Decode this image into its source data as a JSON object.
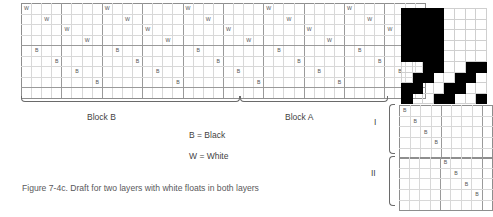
{
  "figure": {
    "caption": "Figure 7-4c. Draft for two layers with white floats in both layers",
    "legend": {
      "black": "B = Black",
      "white": "W = White"
    },
    "blocks": {
      "block_b_label": "Block B",
      "block_a_label": "Block A"
    },
    "layer_labels": {
      "layer_one": "I",
      "layer_two": "II"
    },
    "marks": {
      "black": "B",
      "white": "W"
    },
    "colors": {
      "black": "#000000",
      "white": "#ffffff",
      "grid_line": "#d8d8d8",
      "grid_line_major": "#9a9a9a",
      "text": "#3f3f3f",
      "caption_text": "#59595b"
    }
  },
  "main_draft": {
    "columns": 40,
    "rows": 9,
    "group_size": 4,
    "block_b_columns": [
      0,
      23
    ],
    "block_a_columns": [
      24,
      39
    ],
    "cells": [
      {
        "row": 0,
        "col": 0,
        "mark": "W"
      },
      {
        "row": 0,
        "col": 8,
        "mark": "W"
      },
      {
        "row": 0,
        "col": 16,
        "mark": "W"
      },
      {
        "row": 0,
        "col": 24,
        "mark": "W"
      },
      {
        "row": 0,
        "col": 32,
        "mark": "W"
      },
      {
        "row": 1,
        "col": 2,
        "mark": "W"
      },
      {
        "row": 1,
        "col": 10,
        "mark": "W"
      },
      {
        "row": 1,
        "col": 18,
        "mark": "W"
      },
      {
        "row": 1,
        "col": 26,
        "mark": "W"
      },
      {
        "row": 1,
        "col": 34,
        "mark": "W"
      },
      {
        "row": 2,
        "col": 4,
        "mark": "W"
      },
      {
        "row": 2,
        "col": 12,
        "mark": "W"
      },
      {
        "row": 2,
        "col": 20,
        "mark": "W"
      },
      {
        "row": 2,
        "col": 28,
        "mark": "W"
      },
      {
        "row": 2,
        "col": 36,
        "mark": "W"
      },
      {
        "row": 3,
        "col": 6,
        "mark": "W"
      },
      {
        "row": 3,
        "col": 14,
        "mark": "W"
      },
      {
        "row": 3,
        "col": 22,
        "mark": "W"
      },
      {
        "row": 3,
        "col": 30,
        "mark": "W"
      },
      {
        "row": 3,
        "col": 38,
        "mark": "W"
      },
      {
        "row": 4,
        "col": 1,
        "mark": "B"
      },
      {
        "row": 4,
        "col": 9,
        "mark": "B"
      },
      {
        "row": 4,
        "col": 17,
        "mark": "B"
      },
      {
        "row": 4,
        "col": 25,
        "mark": "B"
      },
      {
        "row": 4,
        "col": 33,
        "mark": "B"
      },
      {
        "row": 5,
        "col": 3,
        "mark": "B"
      },
      {
        "row": 5,
        "col": 11,
        "mark": "B"
      },
      {
        "row": 5,
        "col": 19,
        "mark": "B"
      },
      {
        "row": 5,
        "col": 27,
        "mark": "B"
      },
      {
        "row": 5,
        "col": 35,
        "mark": "B"
      },
      {
        "row": 6,
        "col": 5,
        "mark": "B"
      },
      {
        "row": 6,
        "col": 13,
        "mark": "B"
      },
      {
        "row": 6,
        "col": 21,
        "mark": "B"
      },
      {
        "row": 6,
        "col": 29,
        "mark": "B"
      },
      {
        "row": 6,
        "col": 37,
        "mark": "B"
      },
      {
        "row": 7,
        "col": 7,
        "mark": "B"
      },
      {
        "row": 7,
        "col": 15,
        "mark": "B"
      },
      {
        "row": 7,
        "col": 23,
        "mark": "B"
      },
      {
        "row": 7,
        "col": 31,
        "mark": "B"
      },
      {
        "row": 7,
        "col": 39,
        "mark": "B"
      }
    ]
  },
  "pattern_grid": {
    "columns": 8,
    "rows": 9,
    "black_cells": [
      [
        0,
        0
      ],
      [
        0,
        1
      ],
      [
        0,
        2
      ],
      [
        0,
        3
      ],
      [
        1,
        0
      ],
      [
        1,
        1
      ],
      [
        1,
        2
      ],
      [
        1,
        3
      ],
      [
        2,
        0
      ],
      [
        2,
        1
      ],
      [
        2,
        2
      ],
      [
        2,
        3
      ],
      [
        3,
        0
      ],
      [
        3,
        1
      ],
      [
        3,
        2
      ],
      [
        3,
        3
      ],
      [
        4,
        0
      ],
      [
        4,
        1
      ],
      [
        4,
        2
      ],
      [
        4,
        3
      ],
      [
        5,
        2
      ],
      [
        5,
        3
      ],
      [
        5,
        6
      ],
      [
        5,
        7
      ],
      [
        6,
        1
      ],
      [
        6,
        2
      ],
      [
        6,
        5
      ],
      [
        6,
        6
      ],
      [
        7,
        0
      ],
      [
        7,
        1
      ],
      [
        7,
        4
      ],
      [
        7,
        5
      ],
      [
        8,
        0
      ],
      [
        8,
        3
      ],
      [
        8,
        4
      ],
      [
        8,
        7
      ]
    ]
  },
  "grid_one": {
    "columns": 9,
    "rows": 5,
    "group_size": 4,
    "cells": [
      {
        "row": 0,
        "col": 0,
        "mark": "B"
      },
      {
        "row": 1,
        "col": 1,
        "mark": "B"
      },
      {
        "row": 2,
        "col": 2,
        "mark": "B"
      },
      {
        "row": 3,
        "col": 3,
        "mark": "B"
      }
    ]
  },
  "grid_two": {
    "columns": 9,
    "rows": 5,
    "group_size": 4,
    "cells": [
      {
        "row": 0,
        "col": 4,
        "mark": "B"
      },
      {
        "row": 1,
        "col": 5,
        "mark": "B"
      },
      {
        "row": 2,
        "col": 6,
        "mark": "B"
      },
      {
        "row": 3,
        "col": 7,
        "mark": "B"
      }
    ]
  }
}
